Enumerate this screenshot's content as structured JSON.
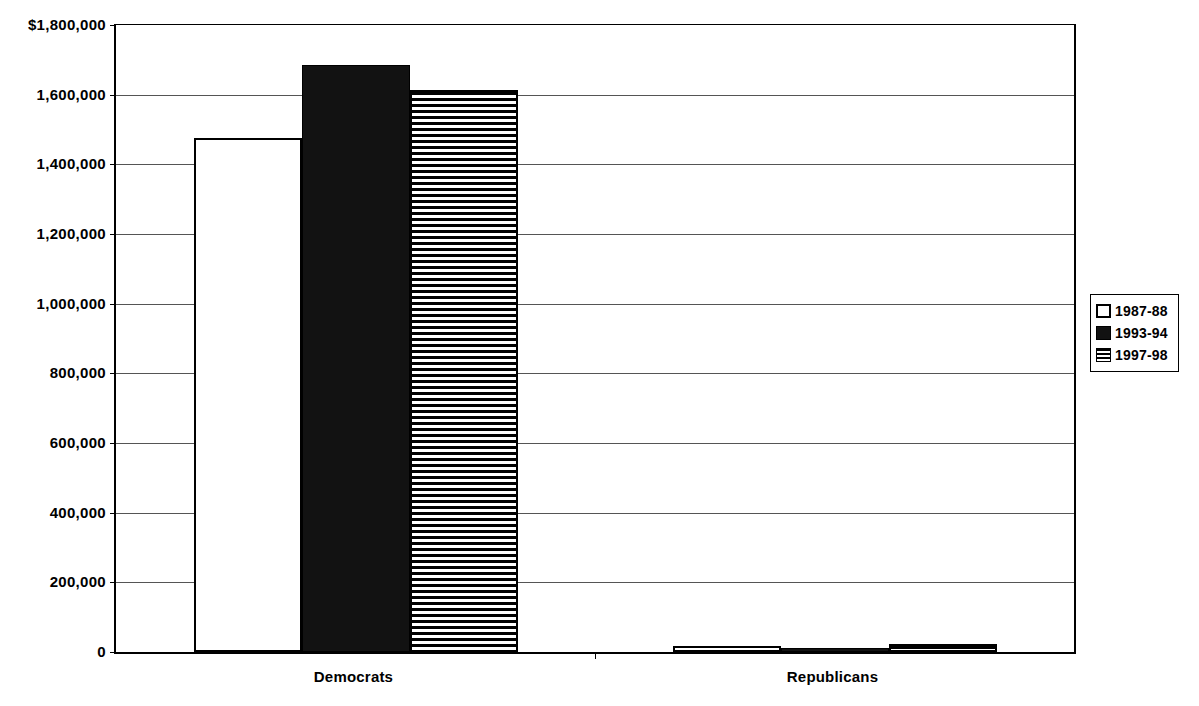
{
  "chart_data": {
    "type": "bar",
    "title": "",
    "subtitle": "",
    "xlabel": "",
    "ylabel": "",
    "categories": [
      "Democrats",
      "Republicans"
    ],
    "series": [
      {
        "name": "1987-88",
        "fill": "open",
        "values": [
          1477000,
          17000
        ]
      },
      {
        "name": "1993-94",
        "fill": "solid",
        "values": [
          1685000,
          11000
        ]
      },
      {
        "name": "1997-98",
        "fill": "striped",
        "values": [
          1613000,
          23000
        ]
      }
    ],
    "ylim": [
      0,
      1800000
    ],
    "ytick_values": [
      0,
      200000,
      400000,
      600000,
      800000,
      1000000,
      1200000,
      1400000,
      1600000,
      1800000
    ],
    "ytick_labels": [
      "0",
      "200,000",
      "400,000",
      "600,000",
      "800,000",
      "1,000,000",
      "1,200,000",
      "1,400,000",
      "1,600,000",
      "$1,800,000"
    ],
    "grid": true,
    "grid_axis": "y",
    "legend_position": "right",
    "colors": {
      "axis": "#000000",
      "gridline": "#555555",
      "bar_open": "#ffffff",
      "bar_solid": "#121212",
      "bar_striped_stripe": "#000000",
      "background": "#ffffff"
    }
  },
  "legend": {
    "entries": [
      {
        "label": "1987-88",
        "fill": "open"
      },
      {
        "label": "1993-94",
        "fill": "solid"
      },
      {
        "label": "1997-98",
        "fill": "striped"
      }
    ]
  },
  "axis": {
    "x_categories": [
      "Democrats",
      "Republicans"
    ]
  }
}
